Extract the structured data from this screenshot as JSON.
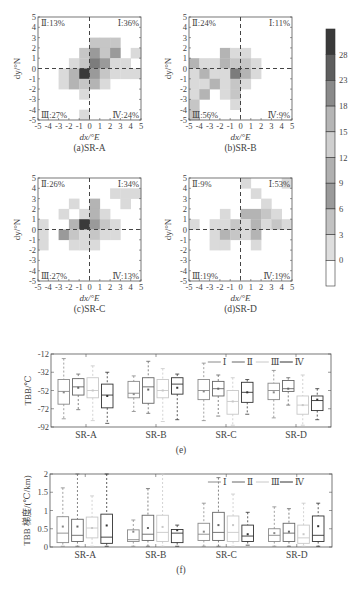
{
  "chart_data": [
    {
      "type": "heatmap",
      "panel": "(a)SR-A",
      "caption": "(a)SR-A",
      "xlabel": "dx/°E",
      "ylabel": "dy/°N",
      "xlim": [
        -5,
        5
      ],
      "ylim": [
        -5,
        5
      ],
      "xticks": [
        "-5",
        "-4",
        "-3",
        "-2",
        "-1",
        "0",
        "1",
        "2",
        "3",
        "4",
        "5"
      ],
      "yticks": [
        "5",
        "4",
        "3",
        "2",
        "1",
        "0",
        "-1",
        "-2",
        "-3",
        "-4",
        "-5"
      ],
      "quadrants": {
        "I": "Ⅰ:36%",
        "II": "Ⅱ:13%",
        "III": "Ⅲ:27%",
        "IV": "Ⅳ:24%"
      },
      "cells": [
        {
          "x": 0,
          "y": 2,
          "v": 9
        },
        {
          "x": 1,
          "y": 2,
          "v": 9
        },
        {
          "x": 2,
          "y": 2,
          "v": 9
        },
        {
          "x": -1,
          "y": 1,
          "v": 9
        },
        {
          "x": 0,
          "y": 1,
          "v": 15
        },
        {
          "x": 1,
          "y": 1,
          "v": 9
        },
        {
          "x": 2,
          "y": 1,
          "v": 15
        },
        {
          "x": 4,
          "y": 1,
          "v": 6
        },
        {
          "x": -2,
          "y": 0,
          "v": 6
        },
        {
          "x": -1,
          "y": 0,
          "v": 9
        },
        {
          "x": 0,
          "y": 0,
          "v": 18
        },
        {
          "x": 1,
          "y": 0,
          "v": 15
        },
        {
          "x": 2,
          "y": 0,
          "v": 6
        },
        {
          "x": 3,
          "y": 0,
          "v": 6
        },
        {
          "x": -3,
          "y": -1,
          "v": 6
        },
        {
          "x": -2,
          "y": -1,
          "v": 12
        },
        {
          "x": -1,
          "y": -1,
          "v": 28
        },
        {
          "x": 0,
          "y": -1,
          "v": 15
        },
        {
          "x": 1,
          "y": -1,
          "v": 9
        },
        {
          "x": 2,
          "y": -1,
          "v": 6
        },
        {
          "x": 3,
          "y": -1,
          "v": 6
        },
        {
          "x": 4,
          "y": -1,
          "v": 6
        },
        {
          "x": -3,
          "y": -2,
          "v": 6
        },
        {
          "x": -2,
          "y": -2,
          "v": 12
        },
        {
          "x": -1,
          "y": -2,
          "v": 9
        },
        {
          "x": 0,
          "y": -2,
          "v": 12
        },
        {
          "x": 1,
          "y": -2,
          "v": 6
        },
        {
          "x": -1,
          "y": -3,
          "v": 6
        },
        {
          "x": -1,
          "y": -5,
          "v": 6
        }
      ]
    },
    {
      "type": "heatmap",
      "panel": "(b)SR-B",
      "caption": "(b)SR-B",
      "xlabel": "dx/°E",
      "ylabel": "dy/°N",
      "xlim": [
        -5,
        5
      ],
      "ylim": [
        -5,
        5
      ],
      "quadrants": {
        "I": "Ⅰ:11%",
        "II": "Ⅱ:24%",
        "III": "Ⅲ:56%",
        "IV": "Ⅳ:9%"
      },
      "cells": [
        {
          "x": -2,
          "y": 1,
          "v": 12
        },
        {
          "x": -1,
          "y": 1,
          "v": 6
        },
        {
          "x": 0,
          "y": 1,
          "v": 6
        },
        {
          "x": -5,
          "y": 0,
          "v": 12
        },
        {
          "x": -4,
          "y": 0,
          "v": 6
        },
        {
          "x": -3,
          "y": 0,
          "v": 6
        },
        {
          "x": -2,
          "y": 0,
          "v": 12
        },
        {
          "x": -1,
          "y": 0,
          "v": 9
        },
        {
          "x": 0,
          "y": 0,
          "v": 9
        },
        {
          "x": 1,
          "y": 0,
          "v": 6
        },
        {
          "x": -5,
          "y": -1,
          "v": 6
        },
        {
          "x": -4,
          "y": -1,
          "v": 12
        },
        {
          "x": -3,
          "y": -1,
          "v": 6
        },
        {
          "x": -2,
          "y": -1,
          "v": 6
        },
        {
          "x": -1,
          "y": -1,
          "v": 18
        },
        {
          "x": 0,
          "y": -1,
          "v": 12
        },
        {
          "x": 1,
          "y": -1,
          "v": 6
        },
        {
          "x": -5,
          "y": -2,
          "v": 6
        },
        {
          "x": -4,
          "y": -2,
          "v": 6
        },
        {
          "x": -3,
          "y": -2,
          "v": 12
        },
        {
          "x": -2,
          "y": -2,
          "v": 6
        },
        {
          "x": -1,
          "y": -2,
          "v": 9
        },
        {
          "x": 0,
          "y": -2,
          "v": 6
        },
        {
          "x": -5,
          "y": -3,
          "v": 6
        },
        {
          "x": -4,
          "y": -3,
          "v": 12
        },
        {
          "x": -2,
          "y": -3,
          "v": 6
        },
        {
          "x": -1,
          "y": -3,
          "v": 9
        },
        {
          "x": -5,
          "y": -4,
          "v": 9
        },
        {
          "x": -1,
          "y": -4,
          "v": 6
        },
        {
          "x": -5,
          "y": -5,
          "v": 9
        }
      ]
    },
    {
      "type": "heatmap",
      "panel": "(c)SR-C",
      "caption": "(c)SR-C",
      "xlabel": "dx/°E",
      "ylabel": "dy/°N",
      "xlim": [
        -5,
        5
      ],
      "ylim": [
        -5,
        5
      ],
      "quadrants": {
        "I": "Ⅰ:34%",
        "II": "Ⅱ:26%",
        "III": "Ⅲ:27%",
        "IV": "Ⅳ:13%"
      },
      "cells": [
        {
          "x": 2,
          "y": 3,
          "v": 6
        },
        {
          "x": 3,
          "y": 3,
          "v": 6
        },
        {
          "x": 4,
          "y": 3,
          "v": 6
        },
        {
          "x": -2,
          "y": 2,
          "v": 6
        },
        {
          "x": 0,
          "y": 2,
          "v": 12
        },
        {
          "x": 3,
          "y": 2,
          "v": 6
        },
        {
          "x": -3,
          "y": 1,
          "v": 6
        },
        {
          "x": -1,
          "y": 1,
          "v": 6
        },
        {
          "x": 0,
          "y": 1,
          "v": 12
        },
        {
          "x": 1,
          "y": 1,
          "v": 6
        },
        {
          "x": -5,
          "y": 0,
          "v": 6
        },
        {
          "x": -2,
          "y": 0,
          "v": 12
        },
        {
          "x": -1,
          "y": 0,
          "v": 28
        },
        {
          "x": 0,
          "y": 0,
          "v": 15
        },
        {
          "x": 1,
          "y": 0,
          "v": 9
        },
        {
          "x": 2,
          "y": 0,
          "v": 6
        },
        {
          "x": -5,
          "y": -1,
          "v": 6
        },
        {
          "x": -3,
          "y": -1,
          "v": 15
        },
        {
          "x": -2,
          "y": -1,
          "v": 9
        },
        {
          "x": -1,
          "y": -1,
          "v": 6
        },
        {
          "x": 0,
          "y": -1,
          "v": 9
        },
        {
          "x": 1,
          "y": -1,
          "v": 6
        },
        {
          "x": 2,
          "y": -1,
          "v": 6
        },
        {
          "x": -5,
          "y": -2,
          "v": 6
        },
        {
          "x": -2,
          "y": -2,
          "v": 6
        },
        {
          "x": -1,
          "y": -2,
          "v": 6
        },
        {
          "x": 0,
          "y": -2,
          "v": 6
        }
      ]
    },
    {
      "type": "heatmap",
      "panel": "(d)SR-D",
      "caption": "(d)SR-D",
      "xlabel": "dx/°E",
      "ylabel": "dy/°N",
      "xlim": [
        -5,
        5
      ],
      "ylim": [
        -5,
        5
      ],
      "quadrants": {
        "I": "Ⅰ:53%",
        "II": "Ⅱ:9%",
        "III": "Ⅲ:19%",
        "IV": "Ⅳ:19%"
      },
      "cells": [
        {
          "x": 0,
          "y": 4,
          "v": 6
        },
        {
          "x": 4,
          "y": 4,
          "v": 6
        },
        {
          "x": 1,
          "y": 3,
          "v": 6
        },
        {
          "x": 2,
          "y": 2,
          "v": 6
        },
        {
          "x": -2,
          "y": 1,
          "v": 6
        },
        {
          "x": 0,
          "y": 1,
          "v": 12
        },
        {
          "x": 1,
          "y": 1,
          "v": 12
        },
        {
          "x": 2,
          "y": 1,
          "v": 9
        },
        {
          "x": 3,
          "y": 1,
          "v": 6
        },
        {
          "x": -5,
          "y": 0,
          "v": 6
        },
        {
          "x": -3,
          "y": 0,
          "v": 6
        },
        {
          "x": -2,
          "y": 0,
          "v": 6
        },
        {
          "x": -1,
          "y": 0,
          "v": 9
        },
        {
          "x": 0,
          "y": 0,
          "v": 6
        },
        {
          "x": 1,
          "y": 0,
          "v": 12
        },
        {
          "x": 2,
          "y": 0,
          "v": 6
        },
        {
          "x": 3,
          "y": 0,
          "v": 9
        },
        {
          "x": 4,
          "y": 0,
          "v": 6
        },
        {
          "x": -3,
          "y": -1,
          "v": 6
        },
        {
          "x": -2,
          "y": -1,
          "v": 12
        },
        {
          "x": -1,
          "y": -1,
          "v": 9
        },
        {
          "x": 0,
          "y": -1,
          "v": 6
        },
        {
          "x": 1,
          "y": -1,
          "v": 12
        },
        {
          "x": -3,
          "y": -2,
          "v": 6
        },
        {
          "x": -2,
          "y": -2,
          "v": 6
        },
        {
          "x": 1,
          "y": -2,
          "v": 6
        }
      ]
    },
    {
      "type": "colorbar",
      "ticks": [
        "28",
        "23",
        "18",
        "15",
        "12",
        "9",
        "6",
        "3",
        "0"
      ],
      "colors": [
        "#3a3a3a",
        "#5e5e5e",
        "#8a8a8a",
        "#b5b5b5",
        "#cfcfcf",
        "#b0b0b0",
        "#9a9a9a",
        "#c2c2c2",
        "#dedede",
        "#ffffff"
      ]
    },
    {
      "type": "box",
      "panel": "(e)",
      "caption": "(e)",
      "ylabel": "TBB/℃",
      "ylim": [
        -92,
        -12
      ],
      "yticks": [
        "-12",
        "-32",
        "-52",
        "-72",
        "-92"
      ],
      "categories": [
        "SR-A",
        "SR-B",
        "SR-C",
        "SR-D"
      ],
      "legend": [
        "Ⅰ",
        "Ⅱ",
        "Ⅲ",
        "Ⅳ"
      ],
      "series": [
        {
          "name": "Ⅰ",
          "boxes": [
            {
              "min": -83,
              "q1": -67,
              "median": -53,
              "q3": -40,
              "max": -17,
              "mean": -54
            },
            {
              "min": -75,
              "q1": -60,
              "median": -55,
              "q3": -42,
              "max": -36,
              "mean": -56
            },
            {
              "min": -85,
              "q1": -62,
              "median": -52,
              "q3": -40,
              "max": -22,
              "mean": -53
            },
            {
              "min": -82,
              "q1": -62,
              "median": -52,
              "q3": -44,
              "max": -30,
              "mean": -54
            }
          ]
        },
        {
          "name": "Ⅱ",
          "boxes": [
            {
              "min": -73,
              "q1": -57,
              "median": -48,
              "q3": -39,
              "max": -34,
              "mean": -49
            },
            {
              "min": -77,
              "q1": -66,
              "median": -48,
              "q3": -38,
              "max": -20,
              "mean": -51
            },
            {
              "min": -80,
              "q1": -58,
              "median": -50,
              "q3": -42,
              "max": -35,
              "mean": -50
            },
            {
              "min": -68,
              "q1": -53,
              "median": -50,
              "q3": -41,
              "max": -38,
              "mean": -50
            }
          ]
        },
        {
          "name": "Ⅲ",
          "boxes": [
            {
              "min": -85,
              "q1": -60,
              "median": -52,
              "q3": -38,
              "max": -25,
              "mean": -52
            },
            {
              "min": -86,
              "q1": -60,
              "median": -52,
              "q3": -40,
              "max": -28,
              "mean": -52
            },
            {
              "min": -90,
              "q1": -78,
              "median": -64,
              "q3": -52,
              "max": -38,
              "mean": -64
            },
            {
              "min": -90,
              "q1": -78,
              "median": -68,
              "q3": -58,
              "max": -35,
              "mean": -68
            }
          ]
        },
        {
          "name": "Ⅳ",
          "boxes": [
            {
              "min": -88,
              "q1": -71,
              "median": -57,
              "q3": -45,
              "max": -32,
              "mean": -58
            },
            {
              "min": -84,
              "q1": -56,
              "median": -45,
              "q3": -38,
              "max": -34,
              "mean": -49
            },
            {
              "min": -78,
              "q1": -65,
              "median": -54,
              "q3": -43,
              "max": -40,
              "mean": -54
            },
            {
              "min": -84,
              "q1": -74,
              "median": -63,
              "q3": -58,
              "max": -50,
              "mean": -62
            }
          ]
        }
      ]
    },
    {
      "type": "box",
      "panel": "(f)",
      "caption": "(f)",
      "ylabel": "TBB 梯度/(℃/km)",
      "ylim": [
        0,
        2
      ],
      "yticks": [
        "2",
        "1.5",
        "1",
        "0.5",
        "0"
      ],
      "categories": [
        "SR-A",
        "SR-B",
        "SR-C",
        "SR-D"
      ],
      "legend": [
        "Ⅰ",
        "Ⅱ",
        "Ⅲ",
        "Ⅳ"
      ],
      "series": [
        {
          "name": "Ⅰ",
          "boxes": [
            {
              "min": 0.02,
              "q1": 0.12,
              "median": 0.38,
              "q3": 0.83,
              "max": 1.62,
              "mean": 0.56
            },
            {
              "min": 0.02,
              "q1": 0.15,
              "median": 0.2,
              "q3": 0.47,
              "max": 0.74,
              "mean": 0.42
            },
            {
              "min": 0.02,
              "q1": 0.18,
              "median": 0.35,
              "q3": 0.65,
              "max": 1.2,
              "mean": 0.42
            },
            {
              "min": 0.02,
              "q1": 0.15,
              "median": 0.32,
              "q3": 0.5,
              "max": 1.1,
              "mean": 0.38
            }
          ]
        },
        {
          "name": "Ⅱ",
          "boxes": [
            {
              "min": 0.02,
              "q1": 0.15,
              "median": 0.32,
              "q3": 0.76,
              "max": 2.0,
              "mean": 0.56
            },
            {
              "min": 0.02,
              "q1": 0.18,
              "median": 0.35,
              "q3": 0.87,
              "max": 1.6,
              "mean": 0.52
            },
            {
              "min": 0.02,
              "q1": 0.18,
              "median": 0.4,
              "q3": 0.95,
              "max": 1.9,
              "mean": 0.6
            },
            {
              "min": 0.02,
              "q1": 0.15,
              "median": 0.38,
              "q3": 0.65,
              "max": 1.05,
              "mean": 0.42
            }
          ]
        },
        {
          "name": "Ⅲ",
          "boxes": [
            {
              "min": 0.02,
              "q1": 0.25,
              "median": 0.52,
              "q3": 0.82,
              "max": 1.4,
              "mean": 0.52
            },
            {
              "min": 0.02,
              "q1": 0.15,
              "median": 0.4,
              "q3": 0.87,
              "max": 2.0,
              "mean": 0.55
            },
            {
              "min": 0.02,
              "q1": 0.15,
              "median": 0.4,
              "q3": 0.85,
              "max": 1.45,
              "mean": 0.6
            },
            {
              "min": 0.02,
              "q1": 0.1,
              "median": 0.25,
              "q3": 0.6,
              "max": 1.2,
              "mean": 0.35
            }
          ]
        },
        {
          "name": "Ⅳ",
          "boxes": [
            {
              "min": 0.02,
              "q1": 0.1,
              "median": 0.27,
              "q3": 0.9,
              "max": 2.0,
              "mean": 0.59
            },
            {
              "min": 0.02,
              "q1": 0.12,
              "median": 0.38,
              "q3": 0.48,
              "max": 0.6,
              "mean": 0.46
            },
            {
              "min": 0.05,
              "q1": 0.15,
              "median": 0.3,
              "q3": 0.6,
              "max": 0.95,
              "mean": 0.35
            },
            {
              "min": 0.02,
              "q1": 0.15,
              "median": 0.32,
              "q3": 0.85,
              "max": 1.2,
              "mean": 0.57
            }
          ]
        }
      ]
    }
  ],
  "labels": {
    "xlabel": "dx/°E",
    "ylabel": "dy/°N",
    "captions": [
      "(a)SR-A",
      "(b)SR-B",
      "(c)SR-C",
      "(d)SR-D"
    ],
    "box_e_caption": "(e)",
    "box_f_caption": "(f)",
    "box_e_ylabel": "TBB/℃",
    "box_f_ylabel": "TBB 梯度/(℃/km)"
  },
  "series_colors": [
    "#8a8a8a",
    "#666666",
    "#c8c8c8",
    "#333333"
  ]
}
